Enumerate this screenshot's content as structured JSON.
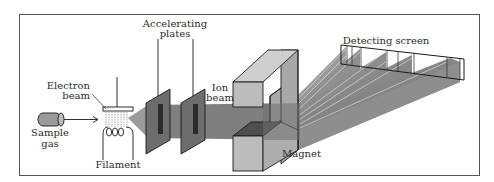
{
  "diagram": {
    "labels": {
      "sample_gas_line1": "Sample",
      "sample_gas_line2": "gas",
      "electron_beam_line1": "Electron",
      "electron_beam_line2": "beam",
      "filament": "Filament",
      "accelerating_plates_line1": "Accelerating",
      "accelerating_plates_line2": "plates",
      "ion_beam_line1": "Ion",
      "ion_beam_line2": "beam",
      "magnet": "Magnet",
      "detecting_screen": "Detecting screen"
    },
    "colors": {
      "frame": "#555555",
      "outline": "#1a1a1a",
      "beam": "#7a7a7a",
      "plate": "#6f6f6f",
      "plate_slot": "#2b2b2b",
      "magnet_front": "#b9b9b9",
      "magnet_side": "#a3a3a3",
      "magnet_top": "#cfcfcf",
      "gas_cylinder": "#9a9a9a"
    }
  }
}
